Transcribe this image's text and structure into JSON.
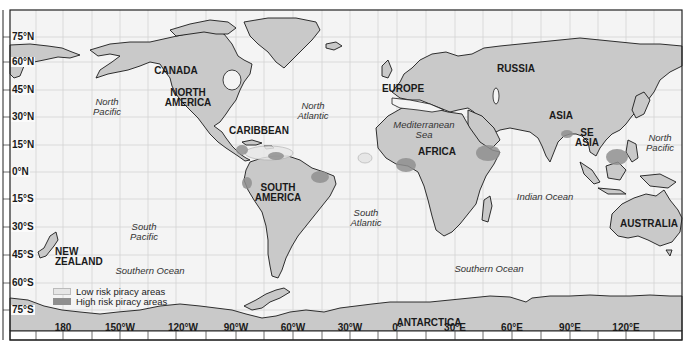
{
  "colors": {
    "ocean": "#f4f4f4",
    "land": "#c9c9c9",
    "coast": "#1a1a1a",
    "grid": "#d4d4d4",
    "low_risk": "#e6e6e6",
    "high_risk": "#8f8f8f"
  },
  "latitude_labels": [
    {
      "text": "75°N",
      "y": 37
    },
    {
      "text": "60°N",
      "y": 62
    },
    {
      "text": "45°N",
      "y": 90
    },
    {
      "text": "30°N",
      "y": 117
    },
    {
      "text": "15°N",
      "y": 145
    },
    {
      "text": "0°N",
      "y": 172
    },
    {
      "text": "15°S",
      "y": 199
    },
    {
      "text": "30°S",
      "y": 227
    },
    {
      "text": "45°S",
      "y": 255
    },
    {
      "text": "60°S",
      "y": 283
    },
    {
      "text": "75°S",
      "y": 310
    }
  ],
  "longitude_labels": [
    {
      "text": "180",
      "x": 63
    },
    {
      "text": "150°W",
      "x": 120
    },
    {
      "text": "120°W",
      "x": 183
    },
    {
      "text": "90°W",
      "x": 236
    },
    {
      "text": "60°W",
      "x": 293
    },
    {
      "text": "30°W",
      "x": 350
    },
    {
      "text": "0°",
      "x": 397
    },
    {
      "text": "30°E",
      "x": 455
    },
    {
      "text": "60°E",
      "x": 512
    },
    {
      "text": "90°E",
      "x": 570
    },
    {
      "text": "120°E",
      "x": 626
    }
  ],
  "regions": [
    {
      "id": "canada",
      "text": "CANADA",
      "x": 176,
      "y": 66
    },
    {
      "id": "north-america",
      "text": "NORTH\nAMERICA",
      "x": 188,
      "y": 94
    },
    {
      "id": "caribbean",
      "text": "CARIBBEAN",
      "x": 259,
      "y": 127
    },
    {
      "id": "south-america",
      "text": "SOUTH\nAMERICA",
      "x": 277,
      "y": 190
    },
    {
      "id": "europe",
      "text": "EUROPE",
      "x": 403,
      "y": 84
    },
    {
      "id": "russia",
      "text": "RUSSIA",
      "x": 516,
      "y": 63
    },
    {
      "id": "asia",
      "text": "ASIA",
      "x": 561,
      "y": 111
    },
    {
      "id": "se-asia",
      "text": "SE\nASIA",
      "x": 586,
      "y": 131
    },
    {
      "id": "africa",
      "text": "AFRICA",
      "x": 436,
      "y": 147
    },
    {
      "id": "australia",
      "text": "AUSTRALIA",
      "x": 649,
      "y": 220
    },
    {
      "id": "new-zealand",
      "text": "NEW\nZEALAND",
      "x": 76,
      "y": 250
    },
    {
      "id": "antarctica",
      "text": "ANTARCTICA",
      "x": 429,
      "y": 322
    }
  ],
  "oceans": [
    {
      "id": "north-pacific-west",
      "text": "North\nPacific",
      "x": 108,
      "y": 101
    },
    {
      "id": "north-pacific-east",
      "text": "North\nPacific",
      "x": 657,
      "y": 139
    },
    {
      "id": "north-atlantic",
      "text": "North\nAtlantic",
      "x": 313,
      "y": 106
    },
    {
      "id": "mediterranean-sea",
      "text": "Mediterranean\nSea",
      "x": 420,
      "y": 126
    },
    {
      "id": "south-pacific",
      "text": "South\nPacific",
      "x": 144,
      "y": 227
    },
    {
      "id": "south-atlantic",
      "text": "South\nAtlantic",
      "x": 366,
      "y": 216
    },
    {
      "id": "indian-ocean",
      "text": "Indian Ocean",
      "x": 544,
      "y": 197
    },
    {
      "id": "southern-ocean-west",
      "text": "Southern Ocean",
      "x": 150,
      "y": 270
    },
    {
      "id": "southern-ocean-east",
      "text": "Southern Ocean",
      "x": 488,
      "y": 268
    }
  ],
  "legend": {
    "items": [
      {
        "label": "Low risk piracy areas",
        "color": "#e6e6e6"
      },
      {
        "label": "High risk piracy areas",
        "color": "#8f8f8f"
      }
    ]
  },
  "piracy_areas": [
    {
      "name": "caribbean-low",
      "risk": "low",
      "cx": 269,
      "cy": 153,
      "rx": 24,
      "ry": 7
    },
    {
      "name": "west-atlantic-low",
      "risk": "low",
      "cx": 365,
      "cy": 158,
      "rx": 7,
      "ry": 5
    },
    {
      "name": "central-america-high",
      "risk": "high",
      "cx": 242,
      "cy": 150,
      "rx": 6,
      "ry": 5
    },
    {
      "name": "venezuela-high",
      "risk": "high",
      "cx": 275,
      "cy": 155,
      "rx": 8,
      "ry": 4
    },
    {
      "name": "ecuador-high",
      "risk": "high",
      "cx": 247,
      "cy": 183,
      "rx": 5,
      "ry": 6
    },
    {
      "name": "brazil-high",
      "risk": "high",
      "cx": 320,
      "cy": 177,
      "rx": 9,
      "ry": 6
    },
    {
      "name": "gulf-of-guinea-high",
      "risk": "high",
      "cx": 406,
      "cy": 165,
      "rx": 10,
      "ry": 7
    },
    {
      "name": "gulf-of-aden-high",
      "risk": "high",
      "cx": 488,
      "cy": 153,
      "rx": 12,
      "ry": 8
    },
    {
      "name": "bay-of-bengal-high",
      "risk": "high",
      "cx": 567,
      "cy": 134,
      "rx": 6,
      "ry": 4
    },
    {
      "name": "south-china-sea-high",
      "risk": "high",
      "cx": 617,
      "cy": 157,
      "rx": 11,
      "ry": 8
    }
  ]
}
